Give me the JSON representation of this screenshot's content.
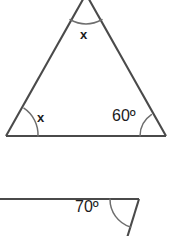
{
  "figure": {
    "background_color": "#ffffff",
    "line_color": "#4a4a4a",
    "arc_color": "#6e6e6e",
    "text_color": "#1c1c1c",
    "shapes": [
      {
        "name": "triangle",
        "description": "Triangle with apex cropped at the top edge of the image; two base angles and one apex angle marked with arcs.",
        "vertices": {
          "apex": [
            86,
            -6
          ],
          "bottom_left": [
            6,
            136
          ],
          "bottom_right": [
            166,
            136
          ]
        },
        "angles": [
          {
            "at": "apex",
            "label": "x"
          },
          {
            "at": "bottom_left",
            "label": "x"
          },
          {
            "at": "bottom_right",
            "label": "60º"
          }
        ]
      },
      {
        "name": "exterior-angle",
        "description": "Horizontal ray and a downward-sloping ray meeting at a vertex, with the angle between them marked.",
        "vertex": [
          139,
          199
        ],
        "rays": {
          "horizontal_to": [
            0,
            199
          ],
          "slanted_to": [
            127,
            236
          ]
        },
        "angles": [
          {
            "at": "vertex",
            "label": "70º"
          }
        ]
      }
    ],
    "labels": {
      "apex_x": "x",
      "left_x": "x",
      "right_60": "60º",
      "bottom_70": "70º"
    }
  }
}
